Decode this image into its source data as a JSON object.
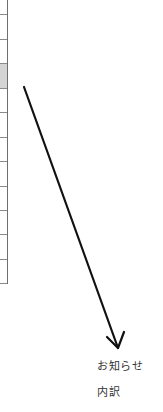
{
  "table": {
    "row_lines_y": [
      14,
      39,
      63,
      88,
      112,
      137,
      161,
      186,
      210,
      234,
      259,
      283
    ],
    "highlighted_row": {
      "top": 64,
      "height": 24,
      "color": "#d4d4d4"
    },
    "border_color": "#6e6e6e"
  },
  "arrow": {
    "from": [
      24,
      87
    ],
    "to": [
      118,
      348
    ],
    "color": "#111111"
  },
  "labels": {
    "line1": "お知らせ",
    "line2": "内訳"
  }
}
